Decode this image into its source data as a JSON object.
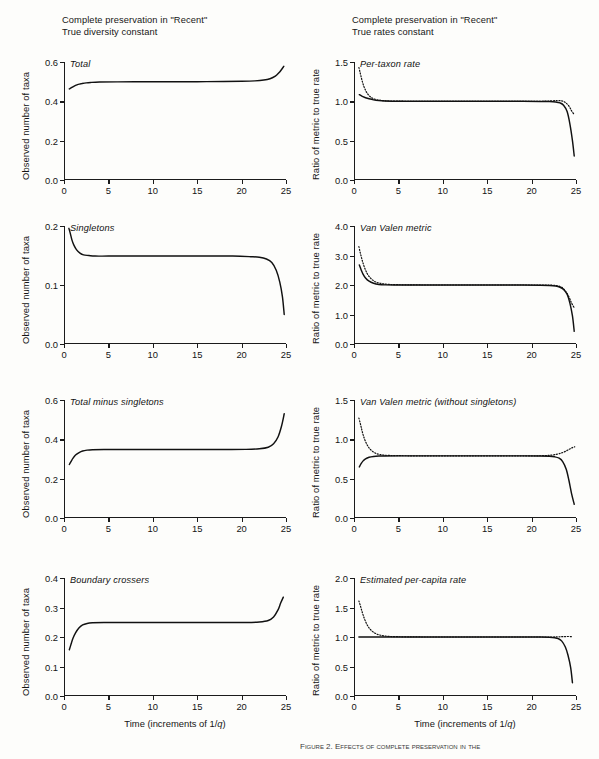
{
  "figure": {
    "width": 599,
    "height": 759,
    "caption_fragment": "Figure 2.  Effects of complete preservation in the",
    "columns": [
      {
        "id": "left",
        "title": "Complete preservation in \"Recent\"\nTrue diversity constant",
        "ylabel": "Observed number of taxa",
        "xlabel_prefix": "Time (increments of 1/",
        "xlabel_italic": "q",
        "xlabel_suffix": ")"
      },
      {
        "id": "right",
        "title": "Complete preservation in \"Recent\"\nTrue rates constant",
        "ylabel": "Ratio of metric to true rate",
        "xlabel_prefix": "Time (increments of 1/",
        "xlabel_italic": "q",
        "xlabel_suffix": ")"
      }
    ]
  },
  "chart_data": [
    {
      "id": "total",
      "type": "line",
      "column": "left",
      "row": 1,
      "title": "Total",
      "xlabel": "Time (increments of 1/q)",
      "ylabel": "Observed number of taxa",
      "xlim": [
        0,
        25
      ],
      "ylim": [
        0,
        0.6
      ],
      "xticks": [
        0,
        5,
        10,
        15,
        20,
        25
      ],
      "yticks": [
        0.0,
        0.2,
        0.4,
        0.6
      ],
      "ytick_labels": [
        "0.0",
        "0.2",
        "0.4",
        "0.6"
      ],
      "grid": false,
      "legend": "none",
      "series": [
        {
          "name": "observed total",
          "style": "solid",
          "x": [
            0.6,
            0.8,
            1.0,
            1.3,
            1.6,
            2.0,
            2.5,
            3.0,
            4.0,
            6.0,
            9.0,
            12.0,
            15.0,
            18.0,
            20.0,
            21.5,
            22.5,
            23.2,
            23.8,
            24.2,
            24.5,
            24.75
          ],
          "y": [
            0.463,
            0.468,
            0.474,
            0.481,
            0.486,
            0.49,
            0.494,
            0.496,
            0.498,
            0.499,
            0.5,
            0.5,
            0.5,
            0.501,
            0.502,
            0.504,
            0.508,
            0.515,
            0.528,
            0.545,
            0.562,
            0.578
          ]
        }
      ]
    },
    {
      "id": "singletons",
      "type": "line",
      "column": "left",
      "row": 2,
      "title": "Singletons",
      "xlabel": "Time (increments of 1/q)",
      "ylabel": "Observed number of taxa",
      "xlim": [
        0,
        25
      ],
      "ylim": [
        0,
        0.2
      ],
      "xticks": [
        0,
        5,
        10,
        15,
        20,
        25
      ],
      "yticks": [
        0.0,
        0.1,
        0.2
      ],
      "ytick_labels": [
        "0.0",
        "0.1",
        "0.2"
      ],
      "grid": false,
      "legend": "none",
      "series": [
        {
          "name": "singletons",
          "style": "solid",
          "x": [
            0.55,
            0.7,
            0.9,
            1.1,
            1.4,
            1.8,
            2.2,
            2.8,
            3.5,
            5.0,
            8.0,
            12.0,
            16.0,
            19.0,
            21.0,
            22.0,
            22.8,
            23.4,
            23.9,
            24.3,
            24.6,
            24.8
          ],
          "y": [
            0.196,
            0.188,
            0.176,
            0.168,
            0.16,
            0.154,
            0.151,
            0.15,
            0.149,
            0.149,
            0.149,
            0.149,
            0.149,
            0.149,
            0.148,
            0.147,
            0.144,
            0.138,
            0.125,
            0.105,
            0.08,
            0.05
          ]
        }
      ]
    },
    {
      "id": "total-minus-singletons",
      "type": "line",
      "column": "left",
      "row": 3,
      "title": "Total minus singletons",
      "xlabel": "Time (increments of 1/q)",
      "ylabel": "Observed number of taxa",
      "xlim": [
        0,
        25
      ],
      "ylim": [
        0,
        0.6
      ],
      "xticks": [
        0,
        5,
        10,
        15,
        20,
        25
      ],
      "yticks": [
        0.0,
        0.2,
        0.4,
        0.6
      ],
      "ytick_labels": [
        "0.0",
        "0.2",
        "0.4",
        "0.6"
      ],
      "grid": false,
      "legend": "none",
      "series": [
        {
          "name": "total minus singletons",
          "style": "solid",
          "x": [
            0.6,
            0.8,
            1.0,
            1.3,
            1.7,
            2.1,
            2.6,
            3.2,
            4.5,
            7.0,
            11.0,
            15.0,
            18.0,
            20.5,
            22.0,
            23.0,
            23.6,
            24.1,
            24.5,
            24.8
          ],
          "y": [
            0.272,
            0.288,
            0.303,
            0.32,
            0.333,
            0.341,
            0.345,
            0.347,
            0.348,
            0.348,
            0.348,
            0.348,
            0.348,
            0.349,
            0.352,
            0.36,
            0.378,
            0.412,
            0.468,
            0.53
          ]
        }
      ]
    },
    {
      "id": "boundary-crossers",
      "type": "line",
      "column": "left",
      "row": 4,
      "title": "Boundary crossers",
      "xlabel": "Time (increments of 1/q)",
      "ylabel": "Observed number of taxa",
      "xlim": [
        0,
        25
      ],
      "ylim": [
        0,
        0.4
      ],
      "xticks": [
        0,
        5,
        10,
        15,
        20,
        25
      ],
      "yticks": [
        0.0,
        0.1,
        0.2,
        0.3,
        0.4
      ],
      "ytick_labels": [
        "0.0",
        "0.1",
        "0.2",
        "0.3",
        "0.4"
      ],
      "grid": false,
      "legend": "none",
      "series": [
        {
          "name": "boundary crossers",
          "style": "solid",
          "x": [
            0.6,
            0.8,
            1.0,
            1.3,
            1.7,
            2.1,
            2.6,
            3.2,
            4.5,
            7.0,
            11.0,
            15.0,
            18.0,
            20.5,
            22.0,
            23.0,
            23.6,
            24.1,
            24.4,
            24.7
          ],
          "y": [
            0.157,
            0.176,
            0.195,
            0.214,
            0.231,
            0.241,
            0.246,
            0.248,
            0.249,
            0.249,
            0.249,
            0.249,
            0.249,
            0.249,
            0.251,
            0.256,
            0.268,
            0.292,
            0.315,
            0.335
          ]
        }
      ]
    },
    {
      "id": "per-taxon-rate",
      "type": "line",
      "column": "right",
      "row": 1,
      "title": "Per-taxon rate",
      "xlabel": "Time (increments of 1/q)",
      "ylabel": "Ratio of metric to true rate",
      "xlim": [
        0,
        25
      ],
      "ylim": [
        0,
        1.5
      ],
      "xticks": [
        0,
        5,
        10,
        15,
        20,
        25
      ],
      "yticks": [
        0.0,
        0.5,
        1.0,
        1.5
      ],
      "ytick_labels": [
        "0.0",
        "0.5",
        "1.0",
        "1.5"
      ],
      "grid": false,
      "legend": "none",
      "series": [
        {
          "name": "solid curve",
          "style": "solid",
          "x": [
            0.6,
            0.8,
            1.0,
            1.3,
            1.7,
            2.2,
            2.8,
            3.5,
            5.0,
            8.0,
            12.0,
            16.0,
            19.0,
            21.0,
            22.0,
            22.7,
            23.2,
            23.6,
            24.0,
            24.3,
            24.6,
            24.8
          ],
          "y": [
            1.085,
            1.072,
            1.06,
            1.046,
            1.032,
            1.019,
            1.01,
            1.005,
            1.001,
            1.0,
            1.0,
            1.0,
            1.0,
            0.999,
            0.997,
            0.992,
            0.98,
            0.95,
            0.87,
            0.72,
            0.5,
            0.305
          ]
        },
        {
          "name": "dotted curve",
          "style": "dotted",
          "x": [
            0.55,
            0.7,
            0.85,
            1.0,
            1.2,
            1.5,
            1.9,
            2.4,
            3.0,
            4.0,
            6.0,
            9.0,
            13.0,
            17.0,
            20.0,
            21.5,
            22.3,
            22.9,
            23.4,
            23.8,
            24.2,
            24.5,
            24.8
          ],
          "y": [
            1.43,
            1.36,
            1.29,
            1.228,
            1.165,
            1.1,
            1.052,
            1.025,
            1.012,
            1.004,
            1.001,
            1.0,
            1.0,
            1.0,
            1.0,
            1.002,
            1.006,
            1.01,
            1.006,
            0.985,
            0.94,
            0.88,
            0.83
          ]
        }
      ]
    },
    {
      "id": "van-valen-metric",
      "type": "line",
      "column": "right",
      "row": 2,
      "title": "Van Valen metric",
      "xlabel": "Time (increments of 1/q)",
      "ylabel": "Ratio of metric to true rate",
      "xlim": [
        0,
        25
      ],
      "ylim": [
        0,
        4.0
      ],
      "xticks": [
        0,
        5,
        10,
        15,
        20,
        25
      ],
      "yticks": [
        0.0,
        1.0,
        2.0,
        3.0,
        4.0
      ],
      "ytick_labels": [
        "0.0",
        "1.0",
        "2.0",
        "3.0",
        "4.0"
      ],
      "grid": false,
      "legend": "none",
      "series": [
        {
          "name": "solid curve",
          "style": "solid",
          "x": [
            0.6,
            0.8,
            1.0,
            1.3,
            1.7,
            2.2,
            2.8,
            3.5,
            5.0,
            8.0,
            12.0,
            16.0,
            19.0,
            21.0,
            22.0,
            22.7,
            23.2,
            23.6,
            24.0,
            24.3,
            24.6,
            24.8
          ],
          "y": [
            2.68,
            2.52,
            2.38,
            2.24,
            2.13,
            2.06,
            2.02,
            2.005,
            2.0,
            2.0,
            2.0,
            2.0,
            1.998,
            1.994,
            1.985,
            1.965,
            1.925,
            1.85,
            1.69,
            1.4,
            0.95,
            0.43
          ]
        },
        {
          "name": "dotted curve",
          "style": "dotted",
          "x": [
            0.55,
            0.7,
            0.85,
            1.0,
            1.2,
            1.5,
            1.9,
            2.4,
            3.0,
            4.0,
            6.0,
            9.0,
            13.0,
            17.0,
            20.0,
            21.5,
            22.3,
            22.9,
            23.4,
            23.8,
            24.2,
            24.5,
            24.8
          ],
          "y": [
            3.3,
            3.1,
            2.92,
            2.76,
            2.58,
            2.38,
            2.22,
            2.11,
            2.055,
            2.02,
            2.004,
            2.0,
            2.0,
            2.0,
            2.0,
            2.0,
            1.995,
            1.975,
            1.92,
            1.8,
            1.6,
            1.39,
            1.23
          ]
        }
      ]
    },
    {
      "id": "van-valen-without-singletons",
      "type": "line",
      "column": "right",
      "row": 3,
      "title": "Van Valen metric (without singletons)",
      "xlabel": "Time (increments of 1/q)",
      "ylabel": "Ratio of metric to true rate",
      "xlim": [
        0,
        25
      ],
      "ylim": [
        0,
        1.5
      ],
      "xticks": [
        0,
        5,
        10,
        15,
        20,
        25
      ],
      "yticks": [
        0.0,
        0.5,
        1.0,
        1.5
      ],
      "ytick_labels": [
        "0.0",
        "0.5",
        "1.0",
        "1.5"
      ],
      "grid": false,
      "legend": "none",
      "series": [
        {
          "name": "solid curve",
          "style": "solid",
          "x": [
            0.6,
            0.8,
            1.0,
            1.3,
            1.7,
            2.2,
            2.8,
            3.5,
            5.0,
            8.0,
            12.0,
            16.0,
            19.0,
            21.0,
            22.0,
            22.6,
            23.1,
            23.5,
            23.9,
            24.2,
            24.5,
            24.8
          ],
          "y": [
            0.65,
            0.69,
            0.723,
            0.752,
            0.772,
            0.782,
            0.787,
            0.789,
            0.79,
            0.79,
            0.79,
            0.79,
            0.79,
            0.789,
            0.786,
            0.778,
            0.76,
            0.718,
            0.62,
            0.48,
            0.31,
            0.175
          ]
        },
        {
          "name": "dotted curve",
          "style": "dotted",
          "x": [
            0.55,
            0.7,
            0.85,
            1.0,
            1.2,
            1.5,
            1.9,
            2.4,
            3.0,
            4.0,
            6.0,
            9.0,
            13.0,
            17.0,
            20.0,
            21.5,
            22.3,
            22.9,
            23.4,
            23.9,
            24.3,
            24.6,
            24.85
          ],
          "y": [
            1.27,
            1.205,
            1.135,
            1.068,
            1.0,
            0.925,
            0.865,
            0.825,
            0.805,
            0.795,
            0.791,
            0.79,
            0.79,
            0.79,
            0.79,
            0.793,
            0.8,
            0.812,
            0.828,
            0.852,
            0.878,
            0.895,
            0.905
          ]
        }
      ]
    },
    {
      "id": "estimated-per-capita-rate",
      "type": "line",
      "column": "right",
      "row": 4,
      "title": "Estimated per-capita rate",
      "xlabel": "Time (increments of 1/q)",
      "ylabel": "Ratio of metric to true rate",
      "xlim": [
        0,
        25
      ],
      "ylim": [
        0,
        2.0
      ],
      "xticks": [
        0,
        5,
        10,
        15,
        20,
        25
      ],
      "yticks": [
        0.0,
        0.5,
        1.0,
        1.5,
        2.0
      ],
      "ytick_labels": [
        "0.0",
        "0.5",
        "1.0",
        "1.5",
        "2.0"
      ],
      "grid": false,
      "legend": "none",
      "series": [
        {
          "name": "solid curve",
          "style": "solid",
          "x": [
            0.55,
            1.0,
            2.0,
            4.0,
            8.0,
            12.0,
            16.0,
            19.0,
            21.0,
            22.0,
            22.6,
            23.0,
            23.4,
            23.8,
            24.1,
            24.4,
            24.6
          ],
          "y": [
            1.0,
            1.0,
            1.0,
            1.0,
            1.0,
            1.0,
            1.0,
            1.0,
            0.999,
            0.996,
            0.988,
            0.972,
            0.93,
            0.83,
            0.69,
            0.48,
            0.225
          ]
        },
        {
          "name": "dotted curve",
          "style": "dotted",
          "x": [
            0.55,
            0.7,
            0.85,
            1.0,
            1.2,
            1.5,
            1.9,
            2.4,
            3.0,
            4.0,
            6.0,
            9.0,
            13.0,
            17.0,
            20.0,
            21.5,
            22.3,
            22.9,
            23.4,
            23.8,
            24.2,
            24.5
          ],
          "y": [
            1.61,
            1.54,
            1.46,
            1.385,
            1.3,
            1.2,
            1.118,
            1.062,
            1.03,
            1.01,
            1.002,
            1.0,
            1.0,
            1.0,
            1.0,
            1.0,
            1.0,
            1.002,
            1.006,
            1.008,
            1.008,
            1.006
          ]
        }
      ]
    }
  ]
}
